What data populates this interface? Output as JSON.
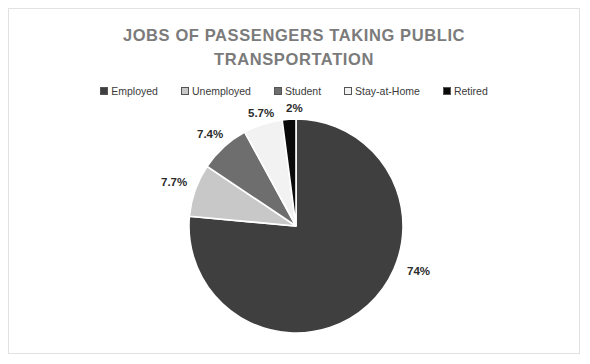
{
  "card": {
    "background": "#ffffff",
    "border_color": "#e2e2e2"
  },
  "title": {
    "line1": "JOBS OF PASSENGERS TAKING PUBLIC",
    "line2": "TRANSPORTATION",
    "color": "#7b7b7b"
  },
  "legend": {
    "position": "top",
    "items": [
      {
        "label": "Employed",
        "color": "#3f3f3f"
      },
      {
        "label": "Unemployed",
        "color": "#c8c8c8"
      },
      {
        "label": "Student",
        "color": "#6e6e6e"
      },
      {
        "label": "Stay-at-Home",
        "color": "#f2f2f2"
      },
      {
        "label": "Retired",
        "color": "#0a0a0a"
      }
    ]
  },
  "chart_data": {
    "type": "pie",
    "title": "JOBS OF PASSENGERS TAKING PUBLIC TRANSPORTATION",
    "categories": [
      "Employed",
      "Unemployed",
      "Student",
      "Stay-at-Home",
      "Retired"
    ],
    "values": [
      74,
      7.7,
      7.4,
      5.7,
      2
    ],
    "data_labels": [
      "74%",
      "7.7%",
      "7.4%",
      "5.7%",
      "2%"
    ],
    "colors": [
      "#3f3f3f",
      "#c8c8c8",
      "#6e6e6e",
      "#f2f2f2",
      "#0a0a0a"
    ],
    "slice_order": "clockwise-from-top",
    "slice_border_color": "#ffffff",
    "legend_position": "top",
    "grid": false,
    "xlabel": "",
    "ylabel": ""
  },
  "labels": {
    "employed_pct": "74%",
    "unemployed_pct": "7.7%",
    "student_pct": "7.4%",
    "stayathome_pct": "5.7%",
    "retired_pct": "2%"
  }
}
